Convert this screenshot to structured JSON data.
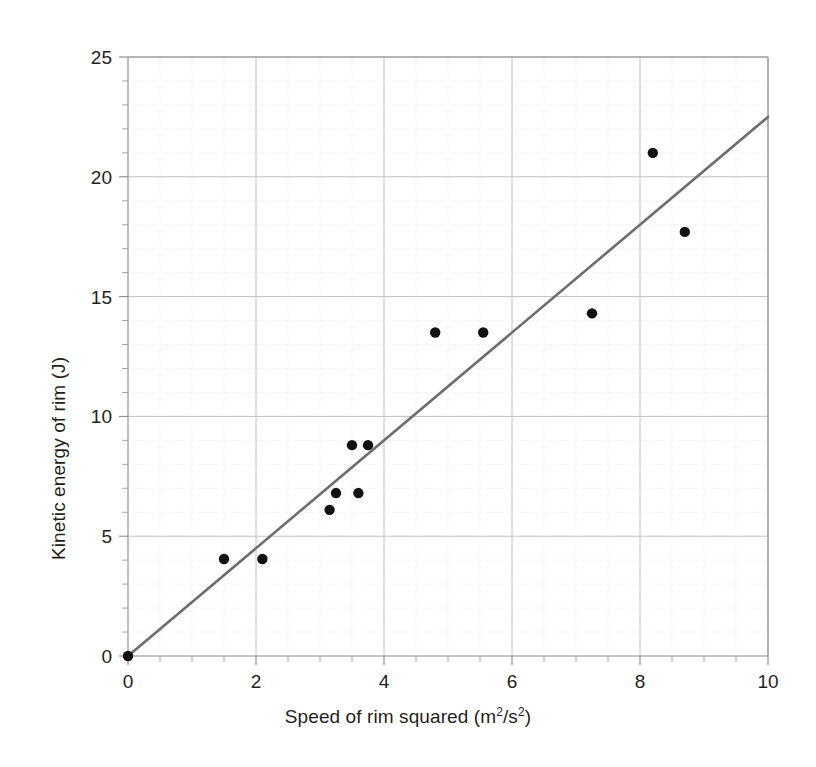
{
  "chart_data": {
    "type": "scatter",
    "title": "",
    "xlabel": "Speed of rim squared (m2/s2)",
    "ylabel": "Kinetic energy of rim (J)",
    "xlabel_parts": {
      "text": "Speed of rim squared (m",
      "sup1": "2",
      "mid": "/s",
      "sup2": "2",
      "tail": ")"
    },
    "xlim": [
      0,
      10
    ],
    "ylim": [
      0,
      25
    ],
    "x_major_step": 2,
    "x_minor_step": 0.5,
    "y_major_step": 5,
    "y_minor_step": 1,
    "xticks": [
      0,
      2,
      4,
      6,
      8,
      10
    ],
    "yticks": [
      0,
      5,
      10,
      15,
      20,
      25
    ],
    "xtick_labels": [
      "0",
      "2",
      "4",
      "6",
      "8",
      "10"
    ],
    "ytick_labels": [
      "0",
      "5",
      "10",
      "15",
      "20",
      "25"
    ],
    "grid": true,
    "grid_major_color": "#b9b9bb",
    "grid_minor_color": "#d9d9dc",
    "legend": false,
    "legend_position": "none",
    "point_color": "#111111",
    "point_radius": 5.2,
    "points": [
      {
        "x": 0.0,
        "y": 0.0
      },
      {
        "x": 1.5,
        "y": 4.05
      },
      {
        "x": 2.1,
        "y": 4.05
      },
      {
        "x": 3.15,
        "y": 6.1
      },
      {
        "x": 3.25,
        "y": 6.8
      },
      {
        "x": 3.6,
        "y": 6.8
      },
      {
        "x": 3.5,
        "y": 8.8
      },
      {
        "x": 3.75,
        "y": 8.8
      },
      {
        "x": 4.8,
        "y": 13.5
      },
      {
        "x": 5.55,
        "y": 13.5
      },
      {
        "x": 7.25,
        "y": 14.3
      },
      {
        "x": 8.2,
        "y": 21.0
      },
      {
        "x": 8.7,
        "y": 17.7
      }
    ],
    "trendline": {
      "name": "line of best fit",
      "color": "#6d6d6d",
      "from": {
        "x": 0,
        "y": 0
      },
      "to": {
        "x": 10,
        "y": 22.5
      },
      "slope": 2.25,
      "intercept": 0
    }
  }
}
